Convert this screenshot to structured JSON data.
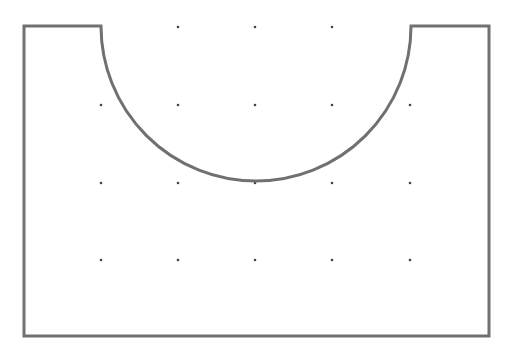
{
  "diagram": {
    "type": "geometric-shape-on-dot-grid",
    "canvas": {
      "width": 516,
      "height": 351,
      "background": "#ffffff"
    },
    "shape": {
      "description": "Rectangle with a semicircular notch cut from the top edge",
      "stroke": "#707070",
      "stroke_width": 3,
      "fill": "none",
      "rect": {
        "left": 24,
        "top": 26,
        "right": 489,
        "bottom": 336
      },
      "notch": {
        "center_x": 256,
        "center_y": 26,
        "radius": 155,
        "start_x": 101,
        "end_x": 411
      }
    },
    "grid": {
      "dot_color": "#444444",
      "dot_radius": 1.3,
      "columns": [
        101,
        178,
        255,
        332,
        410
      ],
      "rows": [
        27,
        105,
        183,
        260
      ],
      "dots": [
        [
          178,
          27
        ],
        [
          255,
          27
        ],
        [
          332,
          27
        ],
        [
          101,
          105
        ],
        [
          178,
          105
        ],
        [
          255,
          105
        ],
        [
          332,
          105
        ],
        [
          410,
          105
        ],
        [
          101,
          183
        ],
        [
          178,
          183
        ],
        [
          255,
          183
        ],
        [
          332,
          183
        ],
        [
          410,
          183
        ],
        [
          101,
          260
        ],
        [
          178,
          260
        ],
        [
          255,
          260
        ],
        [
          332,
          260
        ],
        [
          410,
          260
        ]
      ]
    }
  }
}
